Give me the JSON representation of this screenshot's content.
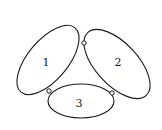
{
  "diagram": {
    "background": "#ffffff",
    "stroke_color": "#1a1a1a",
    "bodies": [
      {
        "id": "1",
        "label": "1",
        "cx": 48,
        "cy": 60,
        "rx": 42,
        "ry": 20,
        "rotation": -50,
        "label_x": 46,
        "label_y": 66
      },
      {
        "id": "2",
        "label": "2",
        "cx": 117,
        "cy": 64,
        "rx": 43,
        "ry": 21,
        "rotation": 47,
        "label_x": 118,
        "label_y": 66
      },
      {
        "id": "3",
        "label": "3",
        "cx": 81,
        "cy": 101,
        "rx": 33,
        "ry": 17,
        "rotation": 0,
        "label_x": 79,
        "label_y": 107
      }
    ],
    "hinges": [
      {
        "id": "hinge-1-2",
        "x": 84,
        "y": 43,
        "r": 2.2
      },
      {
        "id": "hinge-1-3",
        "x": 49,
        "y": 91,
        "r": 2.2
      },
      {
        "id": "hinge-2-3",
        "x": 112,
        "y": 93,
        "r": 2.2
      }
    ]
  }
}
